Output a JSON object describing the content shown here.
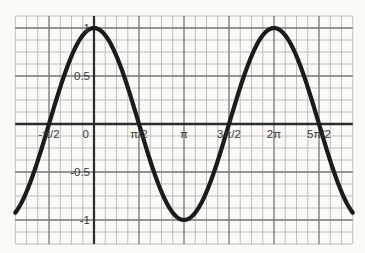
{
  "chart_data": {
    "type": "line",
    "title": "",
    "function_id": "cos",
    "function_label": "y = cos(x)",
    "xlabel": "",
    "ylabel": "",
    "grid": {
      "on": true,
      "x_minor_step_pi": 0.125,
      "y_minor_step": 0.125,
      "minor_per_major": 4
    },
    "x_range_pi": [
      -0.875,
      2.875
    ],
    "y_range": [
      -1.25,
      1.125
    ],
    "x_ticks": [
      {
        "label": "-π/2",
        "value_pi": -0.5
      },
      {
        "label": "0",
        "value_pi": 0
      },
      {
        "label": "π/2",
        "value_pi": 0.5
      },
      {
        "label": "π",
        "value_pi": 1
      },
      {
        "label": "3π/2",
        "value_pi": 1.5
      },
      {
        "label": "2π",
        "value_pi": 2
      },
      {
        "label": "5π/2",
        "value_pi": 2.5
      }
    ],
    "y_ticks": [
      {
        "label": "1",
        "value": 1
      },
      {
        "label": "0.5",
        "value": 0.5
      },
      {
        "label": "-0.5",
        "value": -0.5
      },
      {
        "label": "-1",
        "value": -1
      }
    ],
    "series": [
      {
        "name": "cos(x)",
        "x_pi": [
          -0.875,
          -0.75,
          -0.625,
          -0.5,
          -0.375,
          -0.25,
          -0.125,
          0,
          0.125,
          0.25,
          0.375,
          0.5,
          0.625,
          0.75,
          0.875,
          1,
          1.125,
          1.25,
          1.375,
          1.5,
          1.625,
          1.75,
          1.875,
          2,
          2.125,
          2.25,
          2.375,
          2.5,
          2.625,
          2.75,
          2.875
        ],
        "y": [
          -0.9239,
          -0.7071,
          -0.3827,
          0,
          0.3827,
          0.7071,
          0.9239,
          1,
          0.9239,
          0.7071,
          0.3827,
          0,
          -0.3827,
          -0.7071,
          -0.9239,
          -1,
          -0.9239,
          -0.7071,
          -0.3827,
          0,
          0.3827,
          0.7071,
          0.9239,
          1,
          0.9239,
          0.7071,
          0.3827,
          0,
          -0.3827,
          -0.7071,
          -0.9239
        ]
      }
    ],
    "key_points": {
      "maxima_x_pi": [
        0,
        2
      ],
      "minima_x_pi": [
        1
      ],
      "zero_crossings_x_pi": [
        -0.5,
        0.5,
        1.5,
        2.5
      ]
    },
    "legend": {
      "shown": false
    }
  },
  "colors": {
    "background": "#fbfaf7",
    "grid_minor": "#b7b7b5",
    "grid_major": "#757573",
    "axis": "#2c2c2c",
    "curve": "#1b1b1b",
    "label": "#3a3a3a"
  }
}
